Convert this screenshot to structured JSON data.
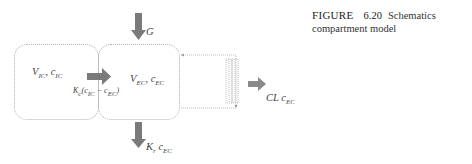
{
  "figure": {
    "caption_label": "FIGURE",
    "caption_number": "6.20",
    "caption_text_line1": "Schematics",
    "caption_text_line2": "compartment model"
  },
  "diagram": {
    "compartments": [
      {
        "id": "ic",
        "volume": "V",
        "volume_sub": "IC",
        "conc": "c",
        "conc_sub": "IC"
      },
      {
        "id": "ec",
        "volume": "V",
        "volume_sub": "EC",
        "conc": "c",
        "conc_sub": "EC"
      }
    ],
    "flows": {
      "input": {
        "label": "G"
      },
      "transfer": {
        "k": "K",
        "k_sub": "c",
        "c1": "c",
        "c1_sub": "IC",
        "c2": "c",
        "c2_sub": "EC"
      },
      "renal": {
        "k": "K",
        "k_sub": "r",
        "c": "c",
        "c_sub": "EC"
      },
      "clearance": {
        "k": "CL",
        "c": "c",
        "c_sub": "EC"
      }
    },
    "colors": {
      "arrow": "#7a7a7a",
      "border": "#b0b0b0"
    }
  }
}
